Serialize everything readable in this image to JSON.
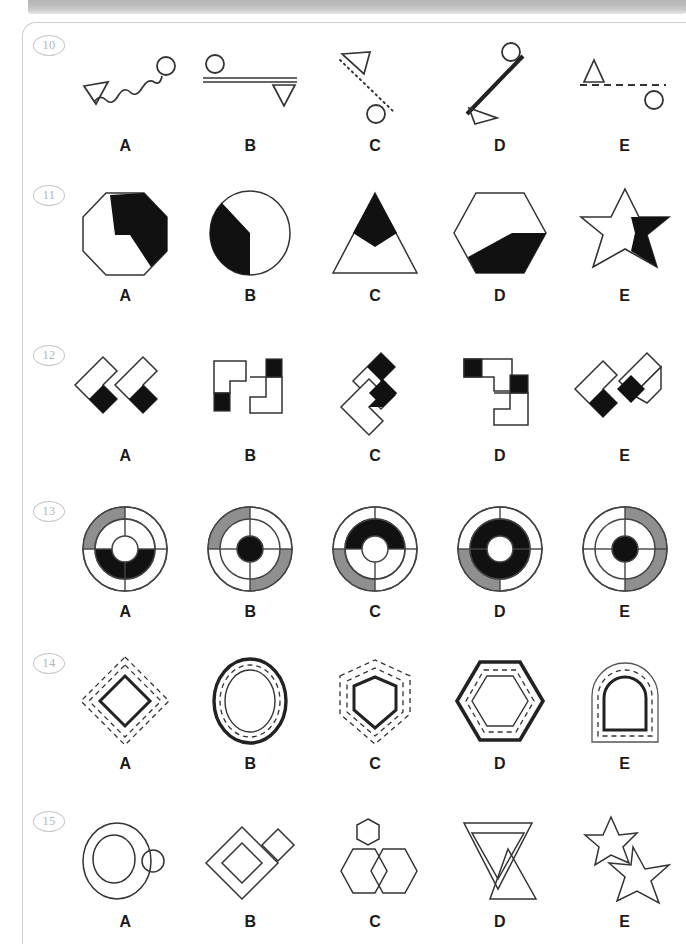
{
  "page": {
    "kind": "visual-reasoning-test-sheet",
    "option_labels": [
      "A",
      "B",
      "C",
      "D",
      "E"
    ],
    "colors": {
      "ink": "#1a1a1a",
      "fill_black": "#111111",
      "fill_gray": "#8f8f8f",
      "fill_white": "#ffffff",
      "border": "#cfcfcf",
      "number_text": "#b5b5b5",
      "top_bar": "#bdbdbd"
    }
  },
  "rows": [
    {
      "number": "10",
      "labels": [
        "A",
        "B",
        "C",
        "D",
        "E"
      ],
      "items": [
        {
          "label": "A",
          "name": "wavy-line-triangle-circle",
          "description": "wavy line with open triangle at lower-left and circle at upper-right"
        },
        {
          "label": "B",
          "name": "double-line-circle-triangle",
          "description": "horizontal double line with circle above left and down-triangle below right"
        },
        {
          "label": "C",
          "name": "dotted-line-triangle-circle",
          "description": "dotted diagonal line with triangle at top and circle at bottom"
        },
        {
          "label": "D",
          "name": "thick-line-circle-triangle",
          "description": "thick diagonal line with circle at top-right and triangle at bottom-left"
        },
        {
          "label": "E",
          "name": "dashed-line-triangle-circle",
          "description": "dashed horizontal line with triangle above left and circle below right"
        }
      ]
    },
    {
      "number": "11",
      "labels": [
        "A",
        "B",
        "C",
        "D",
        "E"
      ],
      "items": [
        {
          "label": "A",
          "name": "octagon-black-wedge",
          "description": "octagon with black zigzag wedge on right side"
        },
        {
          "label": "B",
          "name": "circle-black-sector",
          "description": "circle with black left sector"
        },
        {
          "label": "C",
          "name": "triangle-black-diamond",
          "description": "triangle with black diamond at apex"
        },
        {
          "label": "D",
          "name": "hexagon-black-band",
          "description": "hexagon with black lower-right band"
        },
        {
          "label": "E",
          "name": "six-point-star-black-wedge",
          "description": "six pointed star with black right wedge"
        }
      ]
    },
    {
      "number": "12",
      "labels": [
        "A",
        "B",
        "C",
        "D",
        "E"
      ],
      "items": [
        {
          "label": "A",
          "name": "two-diagonal-zigzags-black-tips",
          "description": "two rotated zigzag blocks with black square tips"
        },
        {
          "label": "B",
          "name": "two-upright-zigzags-black-squares",
          "description": "two upright step blocks with black corner squares"
        },
        {
          "label": "C",
          "name": "stacked-zigzags-black-diamonds",
          "description": "two stacked rotated step blocks with black diamond tips"
        },
        {
          "label": "D",
          "name": "two-step-blocks-black-squares",
          "description": "two step blocks with black squares at corners"
        },
        {
          "label": "E",
          "name": "joined-zigzags-black-diamonds",
          "description": "joined rotated step blocks with black diamonds"
        }
      ]
    },
    {
      "number": "13",
      "labels": [
        "A",
        "B",
        "C",
        "D",
        "E"
      ],
      "items": [
        {
          "label": "A",
          "name": "concentric-rings-gray-ul-black-inner-right-bottom",
          "description": "outer ring gray upper-left quadrant, inner ring black right and bottom quadrants, white hub"
        },
        {
          "label": "B",
          "name": "concentric-rings-gray-ul-lr-black-hub",
          "description": "outer ring gray upper-left and lower-right quadrants, white inner ring, black hub"
        },
        {
          "label": "C",
          "name": "concentric-rings-gray-ll-black-inner-top",
          "description": "outer ring gray lower-left quadrant, inner ring black top quadrant, white hub"
        },
        {
          "label": "D",
          "name": "concentric-rings-gray-ll-black-inner-top-bottom",
          "description": "outer ring gray lower-left quadrant, inner ring black top and bottom quadrants, white hub"
        },
        {
          "label": "E",
          "name": "concentric-rings-gray-right-half-black-hub",
          "description": "outer ring gray upper-right and lower-right quadrants, white inner ring, black hub"
        }
      ]
    },
    {
      "number": "14",
      "labels": [
        "A",
        "B",
        "C",
        "D",
        "E"
      ],
      "items": [
        {
          "label": "A",
          "name": "nested-diamond-dashed",
          "description": "diamond with solid inner, dashed middle and dashed outer outline"
        },
        {
          "label": "B",
          "name": "nested-oval-dashed",
          "description": "oval with thick outer, dashed middle and thin inner outline"
        },
        {
          "label": "C",
          "name": "nested-pentagon-home-dashed",
          "description": "home-plate pentagon with solid inner and dashed outlines"
        },
        {
          "label": "D",
          "name": "nested-hexagon-dashed",
          "description": "hexagon with thick outer, dashed middle and thin inner outline"
        },
        {
          "label": "E",
          "name": "nested-arch-dashed",
          "description": "arch shape with solid inner, dashed middle and thin outer outline"
        }
      ]
    },
    {
      "number": "15",
      "labels": [
        "A",
        "B",
        "C",
        "D",
        "E"
      ],
      "items": [
        {
          "label": "A",
          "name": "circles-big-small-overlap",
          "description": "large oval containing a circle with a small circle overlapping the right edge"
        },
        {
          "label": "B",
          "name": "diamonds-big-small",
          "description": "nested diamond with a small diamond at upper right"
        },
        {
          "label": "C",
          "name": "hexagons-two-big-one-small",
          "description": "two overlapping hexagons with a small hexagon above"
        },
        {
          "label": "D",
          "name": "triangles-nested-and-upright",
          "description": "large down triangle with nested down triangle and an up triangle"
        },
        {
          "label": "E",
          "name": "stars-two-five-point",
          "description": "two overlapping five-pointed stars, small and large"
        }
      ]
    }
  ]
}
